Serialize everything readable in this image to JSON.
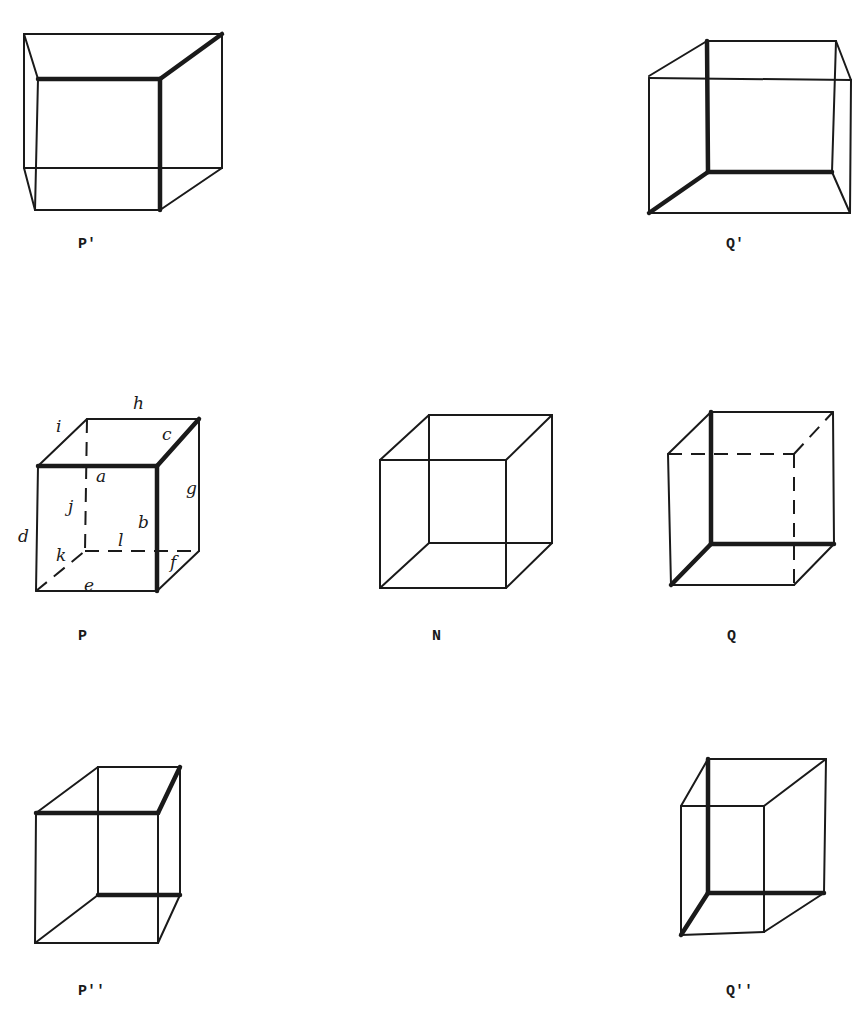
{
  "figure": {
    "colors": {
      "line": "#1a1a1a",
      "background": "#ffffff"
    },
    "cubes": [
      {
        "id": "P-prime",
        "caption": "P'",
        "caption_pos": [
          78,
          236
        ]
      },
      {
        "id": "Q-prime",
        "caption": "Q'",
        "caption_pos": [
          726,
          236
        ]
      },
      {
        "id": "P",
        "caption": "P",
        "caption_pos": [
          78,
          628
        ]
      },
      {
        "id": "N",
        "caption": "N",
        "caption_pos": [
          432,
          628
        ]
      },
      {
        "id": "Q",
        "caption": "Q",
        "caption_pos": [
          727,
          628
        ]
      },
      {
        "id": "P-double-prime",
        "caption": "P''",
        "caption_pos": [
          78,
          983
        ]
      },
      {
        "id": "Q-double-prime",
        "caption": "Q''",
        "caption_pos": [
          726,
          983
        ]
      }
    ],
    "edge_labels": [
      {
        "text": "a",
        "pos": [
          96,
          466
        ]
      },
      {
        "text": "b",
        "pos": [
          138,
          518
        ]
      },
      {
        "text": "c",
        "pos": [
          162,
          426
        ]
      },
      {
        "text": "d",
        "pos": [
          18,
          530
        ]
      },
      {
        "text": "e",
        "pos": [
          84,
          579
        ]
      },
      {
        "text": "f",
        "pos": [
          170,
          556
        ]
      },
      {
        "text": "g",
        "pos": [
          186,
          482
        ]
      },
      {
        "text": "h",
        "pos": [
          133,
          395
        ]
      },
      {
        "text": "i",
        "pos": [
          56,
          418
        ]
      },
      {
        "text": "j",
        "pos": [
          68,
          500
        ]
      },
      {
        "text": "k",
        "pos": [
          56,
          549
        ]
      },
      {
        "text": "l",
        "pos": [
          118,
          536
        ]
      }
    ]
  }
}
